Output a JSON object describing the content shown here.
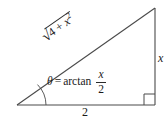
{
  "figure": {
    "type": "right-triangle-diagram",
    "background_color": "#ffffff",
    "stroke_color": "#4a4a4a",
    "text_color": "#1a1a1a"
  },
  "labels": {
    "hypotenuse": {
      "full_text": "√(4 + x²)",
      "radical_sign": "√",
      "radicand_lead": "4 + ",
      "radicand_var": "x",
      "radicand_exponent": "2"
    },
    "angle": {
      "full_text": "θ = arctan x/2",
      "theta": "θ",
      "equals": "=",
      "function": "arctan",
      "fraction_numerator": "x",
      "fraction_denominator": "2"
    },
    "opposite_side": "x",
    "adjacent_side": "2"
  },
  "geometry": {
    "left_vertex": [
      17,
      105
    ],
    "right_vertex": [
      155,
      105
    ],
    "top_vertex": [
      155,
      8
    ],
    "right_angle_marker": "square",
    "angle_arc": "theta"
  }
}
